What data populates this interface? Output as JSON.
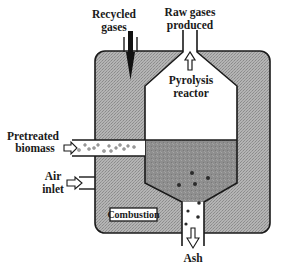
{
  "diagram": {
    "labels": {
      "recycled_gases_line1": "Recycled",
      "recycled_gases_line2": "gases",
      "raw_gases_line1": "Raw gases",
      "raw_gases_line2": "produced",
      "pyrolysis_line1": "Pyrolysis",
      "pyrolysis_line2": "reactor",
      "biomass_line1": "Pretreated",
      "biomass_line2": "biomass",
      "air_line1": "Air",
      "air_line2": "inlet",
      "combustion": "Combustion",
      "ash": "Ash"
    },
    "colors": {
      "combustion_fill": "#a8a8a8",
      "bed_fill": "#8c8c8c",
      "line": "#1a1a1a",
      "background": "#ffffff",
      "particle": "#2a2a2a",
      "biomass_particle": "#9a9a9a"
    },
    "components": [
      "combustion-chamber",
      "pyrolysis-reactor",
      "recycled-gases-inlet",
      "raw-gases-outlet",
      "biomass-feed-tube",
      "air-inlet",
      "ash-outlet"
    ]
  }
}
